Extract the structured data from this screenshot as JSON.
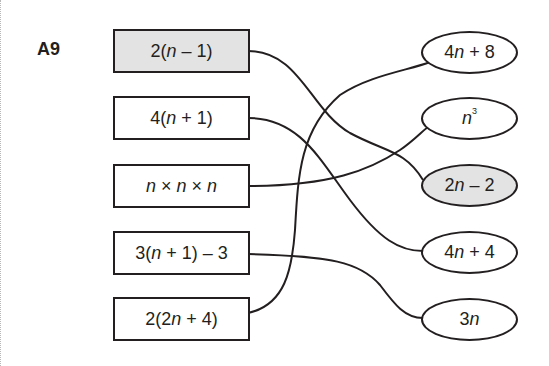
{
  "question": {
    "label": "A9"
  },
  "left_expressions": [
    {
      "text": "2(n – 1)",
      "shaded": true
    },
    {
      "text": "4(n + 1)",
      "shaded": false
    },
    {
      "text": "n × n × n",
      "shaded": false
    },
    {
      "text": "3(n + 1) – 3",
      "shaded": false
    },
    {
      "text": "2(2n + 4)",
      "shaded": false
    }
  ],
  "right_expressions": [
    {
      "text": "4n + 8",
      "shaded": false
    },
    {
      "text": "n³",
      "shaded": false
    },
    {
      "text": "2n – 2",
      "shaded": true
    },
    {
      "text": "4n + 4",
      "shaded": false
    },
    {
      "text": "3n",
      "shaded": false
    }
  ],
  "connections": [
    {
      "from": "2(n – 1)",
      "to": "2n – 2"
    },
    {
      "from": "4(n + 1)",
      "to": "4n + 4"
    },
    {
      "from": "n × n × n",
      "to": "n³"
    },
    {
      "from": "3(n + 1) – 3",
      "to": "3n"
    },
    {
      "from": "2(2n + 4)",
      "to": "4n + 8"
    }
  ],
  "colors": {
    "line": "#231f20",
    "shaded_fill": "#e3e3e3",
    "background": "#ffffff"
  }
}
